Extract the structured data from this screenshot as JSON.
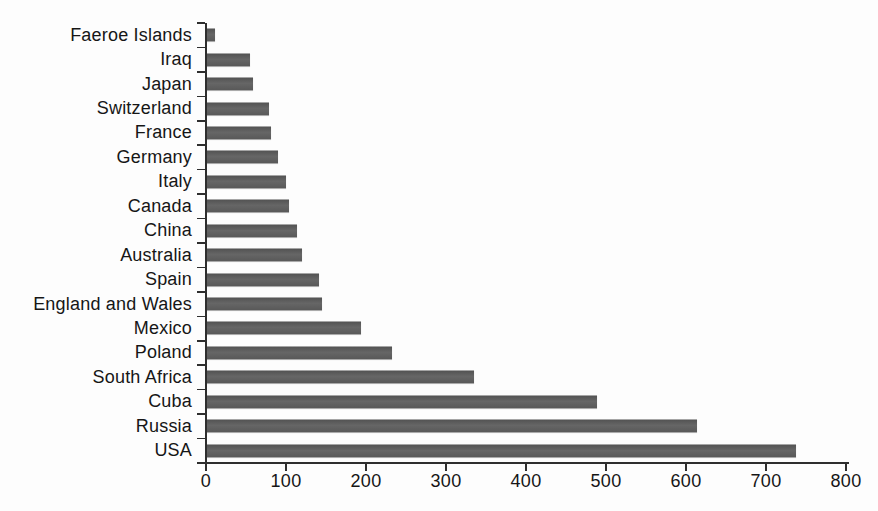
{
  "chart_data": {
    "type": "bar",
    "orientation": "horizontal",
    "title": "",
    "xlabel": "",
    "ylabel": "",
    "grid": false,
    "legend": null,
    "categories": [
      "Faeroe Islands",
      "Iraq",
      "Japan",
      "Switzerland",
      "France",
      "Germany",
      "Italy",
      "Canada",
      "China",
      "Australia",
      "Spain",
      "England and Wales",
      "Mexico",
      "Poland",
      "South Africa",
      "Cuba",
      "Russia",
      "USA"
    ],
    "values": [
      10,
      54,
      57,
      77,
      80,
      89,
      99,
      102,
      113,
      119,
      140,
      144,
      193,
      231,
      334,
      487,
      613,
      736
    ],
    "xlim": [
      0,
      800
    ],
    "x_ticks": [
      0,
      100,
      200,
      300,
      400,
      500,
      600,
      700,
      800
    ],
    "x_tick_labels": [
      "0",
      "100",
      "200",
      "300",
      "400",
      "500",
      "600",
      "700",
      "800"
    ],
    "style": {
      "bar_color": "#5e5e5e",
      "axis_color": "#2e2e2e",
      "text_color": "#161616",
      "background": "#fdfdfd"
    }
  }
}
